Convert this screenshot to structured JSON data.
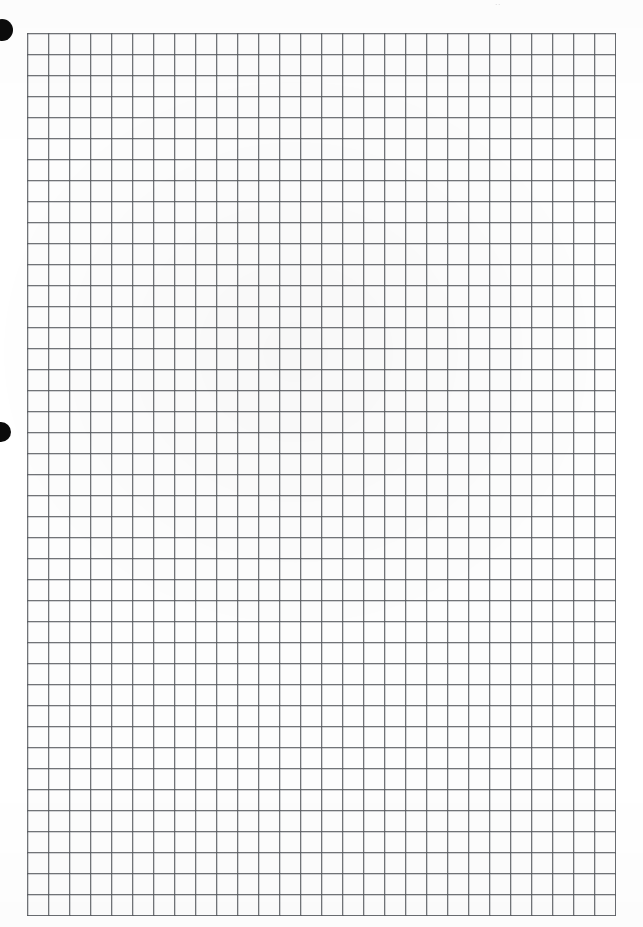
{
  "page": {
    "kind": "scanned-graph-paper-sheet",
    "width": 643,
    "height": 927,
    "background_color": "#ffffff",
    "paper_color": "#fdfdfd"
  },
  "grid": {
    "label": "graph-paper-grid",
    "columns": 28,
    "rows": 42,
    "cell_size_px": 21,
    "left_px": 27,
    "top_px": 33,
    "width_px": 588,
    "height_px": 877,
    "line_color": "#7d8084",
    "line_width_px": 1,
    "cell_fill_color": "#fdfdfd",
    "major_lines": false
  },
  "marks": {
    "label": "binder-punch-marks",
    "color": "#0b0b0b",
    "items": [
      {
        "name": "punch-hole-top",
        "center_x": 2,
        "center_y": 30,
        "diameter": 22
      },
      {
        "name": "punch-hole-middle",
        "center_x": 1,
        "center_y": 432,
        "diameter": 20
      }
    ]
  },
  "artifact": {
    "name": "scan-artifact-top",
    "text": "··",
    "left_px": 495,
    "top_px": 1,
    "description": "faint illegible scan residue"
  }
}
